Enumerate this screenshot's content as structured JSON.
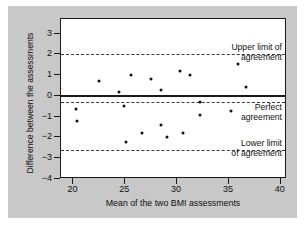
{
  "chart_data": {
    "type": "scatter",
    "title": "",
    "xlabel": "Mean of the two BMI assessments",
    "ylabel": "Difference between the assessments",
    "xlim": [
      18.8,
      40.6
    ],
    "ylim": [
      -4,
      3.7
    ],
    "xticks": [
      20,
      25,
      30,
      35,
      40
    ],
    "yticks": [
      3,
      2,
      1,
      0,
      -1,
      -2,
      -3,
      -4
    ],
    "ytick_labels": [
      "3",
      "2",
      "1",
      "0",
      "−1",
      "−2",
      "−3",
      "−4"
    ],
    "grid": false,
    "legend": "none",
    "points": [
      {
        "x": 20.2,
        "y": -0.62
      },
      {
        "x": 20.3,
        "y": -1.22
      },
      {
        "x": 22.5,
        "y": 0.7
      },
      {
        "x": 24.4,
        "y": 0.2
      },
      {
        "x": 24.9,
        "y": -0.5
      },
      {
        "x": 25.1,
        "y": -2.22
      },
      {
        "x": 25.6,
        "y": 1.02
      },
      {
        "x": 26.6,
        "y": -1.8
      },
      {
        "x": 27.5,
        "y": 0.82
      },
      {
        "x": 28.4,
        "y": 0.3
      },
      {
        "x": 28.4,
        "y": -1.42
      },
      {
        "x": 29.0,
        "y": -1.98
      },
      {
        "x": 30.3,
        "y": 1.22
      },
      {
        "x": 30.6,
        "y": -1.8
      },
      {
        "x": 31.2,
        "y": 1.02
      },
      {
        "x": 32.2,
        "y": -0.3
      },
      {
        "x": 32.2,
        "y": -0.92
      },
      {
        "x": 35.2,
        "y": -0.72
      },
      {
        "x": 35.9,
        "y": 1.53
      },
      {
        "x": 36.6,
        "y": 0.43
      }
    ],
    "reference_lines": [
      {
        "name": "upper-limit-of-agreement",
        "value": 2.0,
        "style": "dashed"
      },
      {
        "name": "perfect-agreement",
        "value": 0.05,
        "style": "solid"
      },
      {
        "name": "bias",
        "value": -0.3,
        "style": "dashed"
      },
      {
        "name": "lower-limit-of-agreement",
        "value": -2.6,
        "style": "dashed"
      }
    ],
    "annotations": [
      {
        "name": "upper-limit-label",
        "line1": "Upper limit of",
        "line2": "agreement"
      },
      {
        "name": "perfect-agreement-label",
        "line1": "Perfect",
        "line2": "agreement"
      },
      {
        "name": "lower-limit-label",
        "line1": "Lower limit",
        "line2": "of agreement"
      }
    ]
  }
}
